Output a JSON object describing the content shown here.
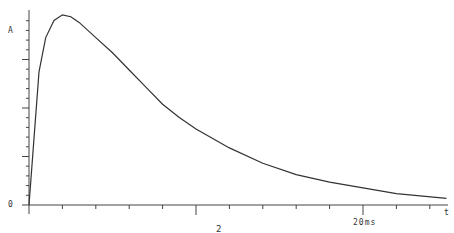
{
  "chart_data": {
    "type": "line",
    "title": "",
    "xlabel": "t",
    "ylabel": "A",
    "x_unit_label": "20ms",
    "y_zero_label": "0",
    "below_axis_label": "2",
    "xlim": [
      0,
      25
    ],
    "ylim": [
      0,
      1.02
    ],
    "grid": false,
    "legend": null,
    "series": [
      {
        "name": "pulse",
        "x": [
          0,
          0.3,
          0.6,
          1.0,
          1.5,
          2.0,
          2.5,
          3,
          4,
          5,
          6,
          7,
          8,
          9,
          10,
          12,
          14,
          16,
          18,
          20,
          22,
          25
        ],
        "values": [
          0,
          0.35,
          0.7,
          0.88,
          0.97,
          1.0,
          0.99,
          0.96,
          0.88,
          0.8,
          0.71,
          0.62,
          0.53,
          0.46,
          0.4,
          0.3,
          0.22,
          0.16,
          0.12,
          0.09,
          0.06,
          0.035
        ]
      }
    ]
  },
  "labels": {
    "y_axis": "A",
    "zero": "0",
    "x_axis_end": "t",
    "x_major": "20ms",
    "footnote": "2"
  }
}
